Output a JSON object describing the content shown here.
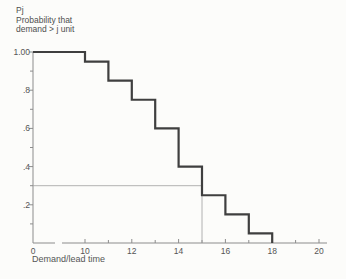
{
  "figure_title_lines": {
    "line1": "Pj",
    "line2": "Probability that",
    "line3": "demand > j unit"
  },
  "colors": {
    "background": "#fcfcfa",
    "curve": "#3f3f3f",
    "axis": "#8c8c8c",
    "reference_line": "#9e9e9e",
    "text": "#4f4f4f"
  },
  "chart_data": {
    "type": "line",
    "subtype": "step",
    "title": "",
    "ylabel_lines": [
      "Pj",
      "Probability that",
      "demand > j unit"
    ],
    "xlabel": "Demand/lead time",
    "xlim": [
      0,
      20
    ],
    "ylim": [
      0,
      1.0
    ],
    "grid": false,
    "x_axis_break_between": [
      0,
      10
    ],
    "x_ticks": {
      "values": [
        0,
        10,
        12,
        14,
        16,
        18,
        20
      ],
      "labels": [
        "0",
        "10",
        "12",
        "14",
        "16",
        "18",
        "20"
      ],
      "minor_values": [
        11,
        13,
        15,
        17,
        19
      ]
    },
    "y_ticks": {
      "values": [
        1.0,
        0.8,
        0.6,
        0.4,
        0.2
      ],
      "labels": [
        "1.00",
        ".8",
        ".6",
        ".4",
        ".2"
      ],
      "minor_values": [
        0.9,
        0.7,
        0.5,
        0.3,
        0.1
      ]
    },
    "steps": [
      {
        "from": 0,
        "to": 10,
        "p": 1.0
      },
      {
        "from": 10,
        "to": 11,
        "p": 0.95
      },
      {
        "from": 11,
        "to": 12,
        "p": 0.85
      },
      {
        "from": 12,
        "to": 13,
        "p": 0.75
      },
      {
        "from": 13,
        "to": 14,
        "p": 0.6
      },
      {
        "from": 14,
        "to": 15,
        "p": 0.4
      },
      {
        "from": 15,
        "to": 16,
        "p": 0.25
      },
      {
        "from": 16,
        "to": 17,
        "p": 0.15
      },
      {
        "from": 17,
        "to": 18,
        "p": 0.05
      },
      {
        "from": 18,
        "to": 18,
        "p": 0.0
      }
    ],
    "reference_lines": {
      "horizontal_p": 0.3,
      "horizontal_from_x": 0,
      "horizontal_to_x": 15,
      "vertical_x": 15,
      "vertical_from_p": 0.3,
      "vertical_to_p": 0.0
    }
  }
}
